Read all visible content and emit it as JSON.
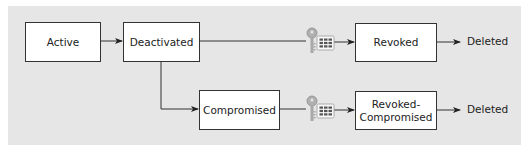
{
  "diagram": {
    "type": "state-flow",
    "states": {
      "active": "Active",
      "deactivated": "Deactivated",
      "compromised": "Compromised",
      "revoked": "Revoked",
      "revoked_compromised_line1": "Revoked-",
      "revoked_compromised_line2": "Compromised",
      "deleted_top": "Deleted",
      "deleted_bottom": "Deleted"
    },
    "transitions": [
      {
        "from": "Active",
        "to": "Deactivated"
      },
      {
        "from": "Deactivated",
        "to": "Revoked",
        "via": "key-certificate-icon"
      },
      {
        "from": "Deactivated",
        "to": "Compromised"
      },
      {
        "from": "Compromised",
        "to": "Revoked-Compromised",
        "via": "key-certificate-icon"
      },
      {
        "from": "Revoked",
        "to": "Deleted"
      },
      {
        "from": "Revoked-Compromised",
        "to": "Deleted"
      }
    ],
    "icons": [
      "key-certificate-icon",
      "key-certificate-icon"
    ],
    "colors": {
      "panel": "#e6e6e6",
      "box_fill": "#ffffff",
      "stroke": "#333333",
      "key": "#a8a8a8",
      "cert_grid": "#555555"
    }
  }
}
